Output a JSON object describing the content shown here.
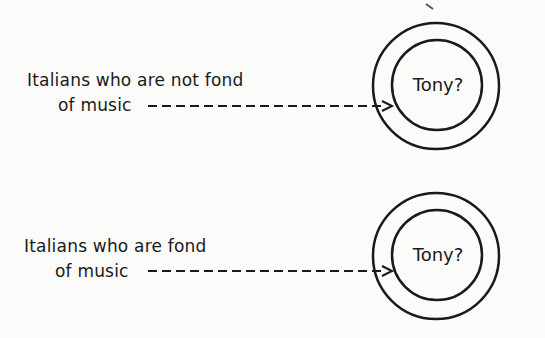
{
  "diagram": {
    "groups": [
      {
        "label_line1": "Italians who are not fond",
        "label_line2": "of music",
        "target": "Tony?"
      },
      {
        "label_line1": "Italians who are fond",
        "label_line2": "of music",
        "target": "Tony?"
      }
    ],
    "colors": {
      "stroke": "#1a1a1a",
      "background": "#fbfbf9"
    }
  }
}
